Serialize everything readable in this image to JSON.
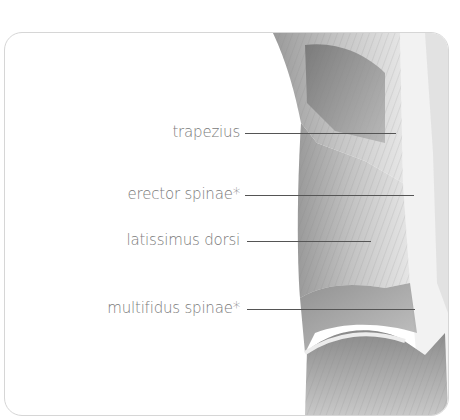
{
  "diagram": {
    "type": "anatomical-illustration",
    "palette": {
      "label_text": "#7a7a7a",
      "leader_line": "#555555",
      "border": "#d6d6d6",
      "background": "#ffffff"
    },
    "labels": [
      {
        "text": "trapezius",
        "label_right_x": 236,
        "y": 100,
        "line_start_x": 244,
        "line_end_x": 395
      },
      {
        "text": "erector spinae*",
        "label_right_x": 236,
        "y": 162,
        "line_start_x": 244,
        "line_end_x": 413
      },
      {
        "text": "latissimus dorsi",
        "label_right_x": 236,
        "y": 208,
        "line_start_x": 246,
        "line_end_x": 370
      },
      {
        "text": "multifidus spinae*",
        "label_right_x": 236,
        "y": 276,
        "line_start_x": 246,
        "line_end_x": 414
      }
    ]
  }
}
